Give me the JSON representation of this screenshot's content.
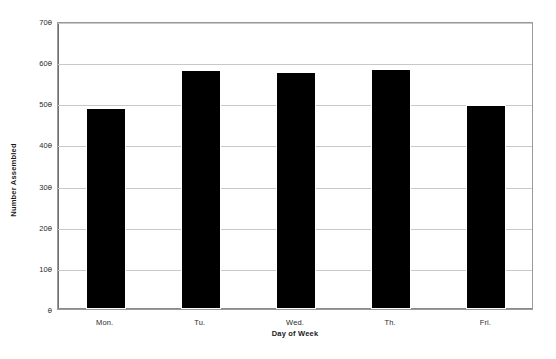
{
  "chart_data": {
    "type": "bar",
    "title": "",
    "subtitle": "",
    "xlabel": "Day of Week",
    "ylabel": "Number Assembled",
    "categories": [
      "Mon.",
      "Tu.",
      "Wed.",
      "Th.",
      "Fri."
    ],
    "values": [
      483,
      577,
      572,
      578,
      491
    ],
    "series": [
      {
        "name": "Number Assembled",
        "values": [
          483,
          577,
          572,
          578,
          491
        ]
      }
    ],
    "ylim": [
      0,
      700
    ],
    "yticks": [
      0,
      100,
      200,
      300,
      400,
      500,
      600,
      700
    ],
    "ytick_labels": [
      "0",
      "100",
      "200",
      "300",
      "400",
      "500",
      "600",
      "700"
    ],
    "grid": true,
    "grid_axis": "y",
    "legend": false,
    "legend_position": "none",
    "bar_color": "#000000",
    "bar_edge_color": "#ffffff",
    "grid_color": "#c8c8c8",
    "axis_color": "#6f6f6f",
    "plot_background": "#ffffff",
    "annotations": []
  }
}
